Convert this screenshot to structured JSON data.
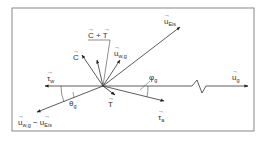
{
  "diagram": {
    "type": "vector-diagram",
    "frame": {
      "x": 12,
      "y": 8,
      "w": 242,
      "h": 123,
      "stroke": "#888888"
    },
    "origin": {
      "x": 103,
      "y": 86
    },
    "vectors": [
      {
        "id": "u_eis",
        "to": [
          180,
          27
        ],
        "label": "u",
        "sub": "Eis",
        "lx": 164,
        "ly": 22
      },
      {
        "id": "u_g",
        "to": [
          248,
          85
        ],
        "label": "u",
        "sub": "g",
        "lx": 232,
        "ly": 78
      },
      {
        "id": "tau_w",
        "to": [
          45,
          85
        ],
        "label": "τ",
        "sub": "w",
        "lx": 46,
        "ly": 79
      },
      {
        "id": "u_wg_minus_u_eis",
        "to": [
          37,
          112
        ],
        "label": "u",
        "sub": "w,g",
        "lx": 18,
        "ly": 126
      },
      {
        "id": "tau_a",
        "to": [
          164,
          101
        ],
        "label": "τ",
        "sub": "a",
        "lx": 158,
        "ly": 121
      },
      {
        "id": "T",
        "to": [
          115,
          95
        ],
        "label": "T",
        "sub": "",
        "lx": 108,
        "ly": 107
      },
      {
        "id": "C",
        "to": [
          82,
          55
        ],
        "label": "C",
        "sub": "",
        "lx": 73,
        "ly": 59
      },
      {
        "id": "C_plus_T",
        "to": [
          97,
          60
        ],
        "label": "",
        "sub": "",
        "lx": 0,
        "ly": 0
      },
      {
        "id": "u_wg",
        "to": [
          120,
          60
        ],
        "label": "u",
        "sub": "w,g",
        "lx": 114,
        "ly": 55
      }
    ],
    "labels": {
      "c_plus_t": "C + T",
      "minus_u_eis": "− u",
      "minus_sub": "Eis",
      "theta": "θ",
      "theta_sub": "g",
      "phi": "φ",
      "phi_sub": "g"
    },
    "colors": {
      "line": "#333333",
      "frame": "#888888"
    }
  }
}
